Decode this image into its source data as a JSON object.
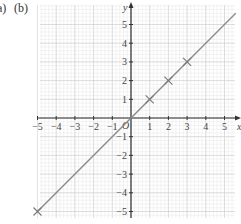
{
  "labels": {
    "part_a": "a)",
    "part_b": "(b)"
  },
  "chart_data": {
    "type": "line",
    "title": "",
    "xlabel": "x",
    "ylabel": "y",
    "xlim": [
      -5,
      5.6
    ],
    "ylim": [
      -5,
      5.6
    ],
    "x_ticks": [
      -5,
      -4,
      -3,
      -2,
      -1,
      1,
      2,
      3,
      4,
      5
    ],
    "y_ticks": [
      -5,
      -4,
      -3,
      -2,
      -1,
      1,
      2,
      3,
      4,
      5
    ],
    "origin_label": "O",
    "grid": true,
    "series": [
      {
        "name": "y = x",
        "line": {
          "x": [
            -5,
            5.6
          ],
          "y": [
            -5,
            5.6
          ]
        },
        "markers": {
          "x": [
            -5,
            0,
            1,
            2,
            3
          ],
          "y": [
            -5,
            0,
            1,
            2,
            3
          ]
        }
      }
    ],
    "colors": {
      "grid_minor": "#e6e6e6",
      "grid_major": "#cfcfcf",
      "axis": "#333333",
      "line": "#8a8a8a"
    }
  }
}
